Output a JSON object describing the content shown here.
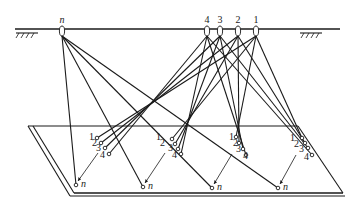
{
  "diagram": {
    "type": "suspension-cable-rigging",
    "ceiling": {
      "supports": [
        "fixed-support-left",
        "fixed-support-right"
      ],
      "pulleys": [
        {
          "id": "n",
          "label": "n"
        },
        {
          "id": "4",
          "label": "4"
        },
        {
          "id": "3",
          "label": "3"
        },
        {
          "id": "2",
          "label": "2"
        },
        {
          "id": "1",
          "label": "1"
        }
      ]
    },
    "platform": {
      "shape": "parallelogram",
      "groups": [
        {
          "attach_labels": [
            "1",
            "2",
            "3",
            "4"
          ],
          "n_label": "n"
        },
        {
          "attach_labels": [
            "1",
            "2",
            "3",
            "4"
          ],
          "n_label": "n"
        },
        {
          "attach_labels": [
            "1",
            "2",
            "3",
            "4"
          ],
          "n_label": "n"
        },
        {
          "attach_labels": [
            "1",
            "2",
            "3",
            "4"
          ],
          "n_label": "n"
        }
      ]
    },
    "connections": "Each pulley 1–4 connects to the same-numbered attachment point in all four groups; pulley n connects to each group's point n"
  }
}
